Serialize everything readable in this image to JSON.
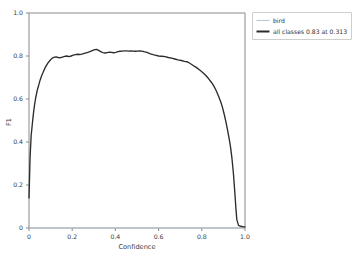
{
  "chart_data": {
    "type": "line",
    "title": "",
    "xlabel": "Confidence",
    "ylabel": "F1",
    "xlim": [
      0.0,
      1.0
    ],
    "ylim": [
      0.0,
      1.0
    ],
    "grid": false,
    "legend_position": "outside-right-top",
    "xticks": [
      "0",
      "0.2",
      "0.4",
      "0.6",
      "0.8",
      "1.0"
    ],
    "xtick_values": [
      0,
      0.2,
      0.4,
      0.6,
      0.8,
      1.0
    ],
    "yticks": [
      "0",
      "0.2",
      "0.4",
      "0.6",
      "0.8",
      "1.0"
    ],
    "ytick_values": [
      0,
      0.2,
      0.4,
      0.6,
      0.8,
      1.0
    ],
    "legend": [
      {
        "label": "bird",
        "color": "#b9c6da",
        "style": "thin"
      },
      {
        "label": "all classes 0.83 at 0.313",
        "color": "#2c2c2c",
        "style": "thick"
      }
    ],
    "annotation": {
      "best_f1": 0.83,
      "best_confidence": 0.313
    },
    "series": [
      {
        "name": "all classes",
        "color": "#2c2c2c",
        "x": [
          0.0,
          0.005,
          0.01,
          0.014,
          0.018,
          0.022,
          0.026,
          0.03,
          0.035,
          0.04,
          0.046,
          0.052,
          0.058,
          0.065,
          0.072,
          0.08,
          0.088,
          0.096,
          0.105,
          0.115,
          0.125,
          0.135,
          0.145,
          0.155,
          0.165,
          0.175,
          0.185,
          0.195,
          0.205,
          0.215,
          0.225,
          0.235,
          0.245,
          0.255,
          0.265,
          0.275,
          0.285,
          0.295,
          0.305,
          0.313,
          0.322,
          0.332,
          0.342,
          0.352,
          0.362,
          0.372,
          0.382,
          0.392,
          0.402,
          0.412,
          0.422,
          0.432,
          0.442,
          0.452,
          0.462,
          0.472,
          0.482,
          0.492,
          0.502,
          0.512,
          0.522,
          0.532,
          0.542,
          0.552,
          0.562,
          0.575,
          0.588,
          0.6,
          0.615,
          0.63,
          0.645,
          0.66,
          0.675,
          0.69,
          0.705,
          0.72,
          0.735,
          0.748,
          0.76,
          0.772,
          0.784,
          0.796,
          0.808,
          0.82,
          0.832,
          0.844,
          0.856,
          0.868,
          0.878,
          0.888,
          0.896,
          0.904,
          0.912,
          0.92,
          0.928,
          0.934,
          0.94,
          0.946,
          0.95,
          0.954,
          0.958,
          0.962,
          0.97,
          0.98,
          0.99,
          1.0
        ],
        "y": [
          0.14,
          0.33,
          0.43,
          0.47,
          0.51,
          0.545,
          0.575,
          0.6,
          0.625,
          0.648,
          0.668,
          0.69,
          0.707,
          0.723,
          0.74,
          0.755,
          0.768,
          0.778,
          0.788,
          0.794,
          0.796,
          0.793,
          0.792,
          0.795,
          0.798,
          0.8,
          0.797,
          0.8,
          0.804,
          0.806,
          0.808,
          0.807,
          0.809,
          0.812,
          0.815,
          0.818,
          0.822,
          0.826,
          0.83,
          0.831,
          0.826,
          0.82,
          0.816,
          0.814,
          0.816,
          0.818,
          0.817,
          0.815,
          0.817,
          0.82,
          0.822,
          0.823,
          0.824,
          0.824,
          0.823,
          0.824,
          0.823,
          0.822,
          0.823,
          0.824,
          0.823,
          0.82,
          0.818,
          0.814,
          0.81,
          0.806,
          0.803,
          0.8,
          0.799,
          0.797,
          0.793,
          0.79,
          0.786,
          0.782,
          0.779,
          0.775,
          0.772,
          0.764,
          0.756,
          0.748,
          0.74,
          0.73,
          0.72,
          0.708,
          0.694,
          0.678,
          0.66,
          0.636,
          0.612,
          0.586,
          0.56,
          0.528,
          0.492,
          0.452,
          0.408,
          0.37,
          0.32,
          0.258,
          0.205,
          0.15,
          0.09,
          0.04,
          0.012,
          0.008,
          0.006,
          0.005
        ]
      },
      {
        "name": "bird",
        "color": "#b9c6da",
        "x": [
          0.0,
          0.1,
          0.313,
          0.6,
          0.9,
          1.0
        ],
        "y": [
          0.0,
          0.0,
          0.0,
          0.0,
          0.0,
          0.0
        ]
      }
    ]
  },
  "figure": {
    "background": "#ffffff",
    "axis_color": "#7d7d7d"
  }
}
